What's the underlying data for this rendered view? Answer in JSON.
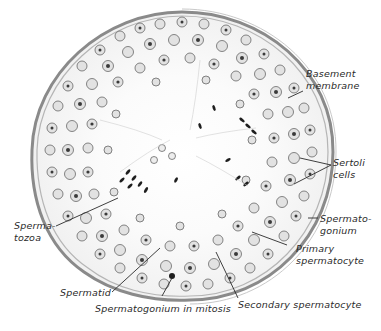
{
  "figure": {
    "colors": {
      "background": "#ffffff",
      "ink": "#2a2a2a",
      "membrane": "#8a8a8a",
      "nucleus_fill": "#d9d9d9",
      "chromatin": "#3a3a3a",
      "spermatozoa": "#1e1e1e"
    },
    "tubule": {
      "cx": 182,
      "cy": 155,
      "rx": 150,
      "ry": 143
    }
  },
  "labels": {
    "basement_membrane": {
      "line1": "Basement",
      "line2": "membrane"
    },
    "sertoli_cells": {
      "line1": "Sertoli",
      "line2": "cells"
    },
    "spermatogonium": {
      "line1": "Spermato-",
      "line2": "gonium"
    },
    "primary_spermatocyte": {
      "line1": "Primary",
      "line2": "spermatocyte"
    },
    "secondary_spermatocyte": {
      "text": "Secondary spermatocyte"
    },
    "spermatogonium_mitosis": {
      "text": "Spermatogonium  in  mitosis"
    },
    "spermatid": {
      "text": "Spermatid"
    },
    "spermatozoa": {
      "line1": "Sperma-",
      "line2": "tozoa"
    }
  }
}
